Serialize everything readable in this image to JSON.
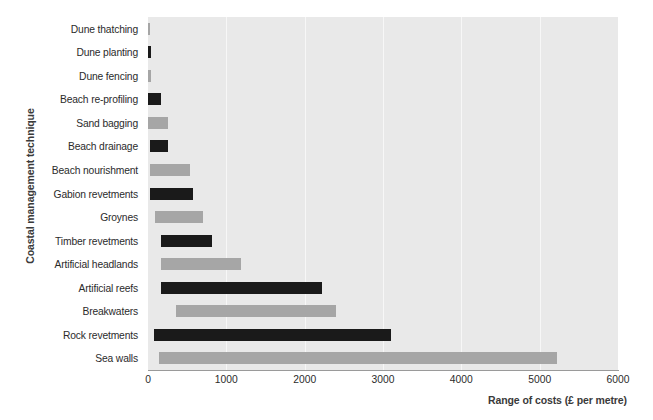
{
  "chart_data": {
    "type": "bar",
    "orientation": "horizontal",
    "title": "",
    "xlabel": "Range of costs (£ per metre)",
    "ylabel": "Coastal management technique",
    "xlim": [
      0,
      6000
    ],
    "xticks": [
      0,
      1000,
      2000,
      3000,
      4000,
      5000,
      6000
    ],
    "xtick_labels": [
      "0",
      "1000",
      "2000",
      "3000",
      "4000",
      "5000",
      "6000"
    ],
    "grid": true,
    "legend": "none",
    "plot_background": "#e9e9e9",
    "colors": {
      "dark": "#1a1a1a",
      "light": "#a6a6a6"
    },
    "categories": [
      "Dune thatching",
      "Dune planting",
      "Dune fencing",
      "Beach re-profiling",
      "Sand bagging",
      "Beach drainage",
      "Beach nourishment",
      "Gabion revetments",
      "Groynes",
      "Timber revetments",
      "Artificial headlands",
      "Artificial reefs",
      "Breakwaters",
      "Rock revetments",
      "Sea walls"
    ],
    "bars": [
      {
        "category": "Dune thatching",
        "low": 0,
        "high": 30,
        "color": "light"
      },
      {
        "category": "Dune planting",
        "low": 0,
        "high": 40,
        "color": "dark"
      },
      {
        "category": "Dune fencing",
        "low": 0,
        "high": 35,
        "color": "light"
      },
      {
        "category": "Beach re-profiling",
        "low": 0,
        "high": 160,
        "color": "dark"
      },
      {
        "category": "Sand bagging",
        "low": 0,
        "high": 250,
        "color": "light"
      },
      {
        "category": "Beach drainage",
        "low": 30,
        "high": 250,
        "color": "dark"
      },
      {
        "category": "Beach nourishment",
        "low": 30,
        "high": 540,
        "color": "light"
      },
      {
        "category": "Gabion revetments",
        "low": 20,
        "high": 580,
        "color": "dark"
      },
      {
        "category": "Groynes",
        "low": 90,
        "high": 700,
        "color": "light"
      },
      {
        "category": "Timber revetments",
        "low": 170,
        "high": 820,
        "color": "dark"
      },
      {
        "category": "Artificial headlands",
        "low": 170,
        "high": 1190,
        "color": "light"
      },
      {
        "category": "Artificial reefs",
        "low": 170,
        "high": 2220,
        "color": "dark"
      },
      {
        "category": "Breakwaters",
        "low": 360,
        "high": 2400,
        "color": "light"
      },
      {
        "category": "Rock revetments",
        "low": 80,
        "high": 3100,
        "color": "dark"
      },
      {
        "category": "Sea walls",
        "low": 140,
        "high": 5220,
        "color": "light"
      }
    ]
  }
}
